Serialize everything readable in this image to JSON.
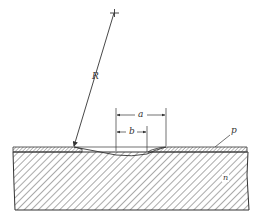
{
  "diagram": {
    "type": "cross-section",
    "labels": {
      "radius": "R",
      "dim_a": "a",
      "dim_b": "b",
      "layer_p": "p",
      "substrate_n": "n"
    },
    "colors": {
      "ink": "#333333",
      "background": "#ffffff"
    }
  }
}
